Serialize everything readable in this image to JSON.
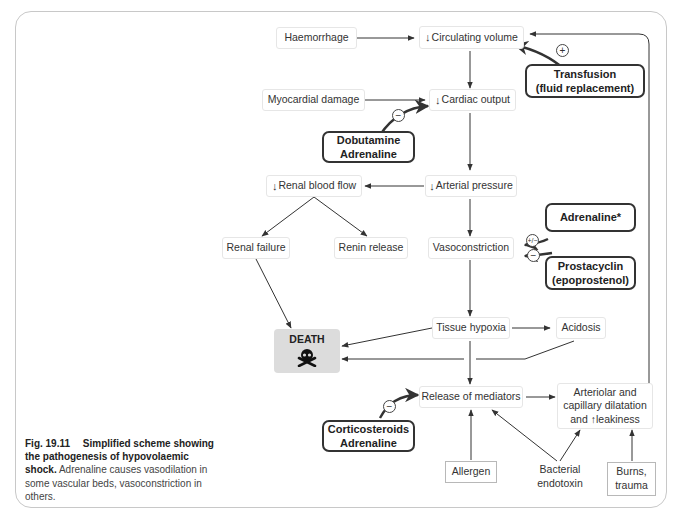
{
  "figure": {
    "caption_label": "Fig. 19.11",
    "caption_title": "Simplified scheme showing the pathogenesis of hypovolaemic shock.",
    "caption_text": "Adrenaline causes vasodilation in some vascular beds, vasoconstriction in others."
  },
  "nodes": {
    "haemorrhage": "Haemorrhage",
    "circulating_volume": "Circulating volume",
    "myocardial_damage": "Myocardial damage",
    "cardiac_output": "Cardiac output",
    "renal_blood_flow": "Renal blood flow",
    "arterial_pressure": "Arterial pressure",
    "renal_failure": "Renal failure",
    "renin_release": "Renin release",
    "vasoconstriction": "Vasoconstriction",
    "tissue_hypoxia": "Tissue hypoxia",
    "acidosis": "Acidosis",
    "death": "DEATH",
    "release_of_mediators": "Release of mediators",
    "arteriolar_line1": "Arteriolar and",
    "arteriolar_line2": "capillary dilatation",
    "arteriolar_line3_pre": "and",
    "arteriolar_line3_post": "leakiness",
    "allergen": "Allergen",
    "bacterial_line1": "Bacterial",
    "bacterial_line2": "endotoxin",
    "burns_line1": "Burns,",
    "burns_line2": "trauma"
  },
  "drugs": {
    "transfusion_line1": "Transfusion",
    "transfusion_line2": "(fluid replacement)",
    "dobutamine_line1": "Dobutamine",
    "dobutamine_line2": "Adrenaline",
    "adrenaline_star": "Adrenaline*",
    "prostacyclin_line1": "Prostacyclin",
    "prostacyclin_line2": "(epoprostenol)",
    "corticosteroids_line1": "Corticosteroids",
    "corticosteroids_line2": "Adrenaline"
  },
  "symbols": {
    "decrease_arrow": "↓",
    "increase_arrow": "↑",
    "plus": "+",
    "minus": "−",
    "plus_minus": "+/−"
  },
  "effects": {
    "transfusion": "+",
    "dobutamine": "−",
    "adrenaline_star": "+/−",
    "prostacyclin": "−",
    "corticosteroids": "−"
  }
}
